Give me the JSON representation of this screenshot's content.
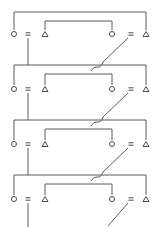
{
  "diagram": {
    "type": "repeating-switch-ladder",
    "stroke_color": "#5a5a5a",
    "background": "#ffffff",
    "stages": [
      {
        "index": 0,
        "symbol_y": 34,
        "left_symbols": [
          "circle",
          "equals",
          "triangle"
        ],
        "right_symbols": [
          "circle",
          "equals",
          "triangle"
        ],
        "outer_bracket_y": 12,
        "inner_bracket_y": 21
      },
      {
        "index": 1,
        "symbol_y": 89,
        "left_symbols": [
          "circle",
          "equals",
          "triangle"
        ],
        "right_symbols": [
          "circle",
          "equals",
          "triangle"
        ],
        "outer_bracket_y": 65,
        "inner_bracket_y": 74
      },
      {
        "index": 2,
        "symbol_y": 144,
        "left_symbols": [
          "circle",
          "equals",
          "triangle"
        ],
        "right_symbols": [
          "circle",
          "equals",
          "triangle"
        ],
        "outer_bracket_y": 120,
        "inner_bracket_y": 129
      },
      {
        "index": 3,
        "symbol_y": 199,
        "left_symbols": [
          "circle",
          "equals",
          "triangle"
        ],
        "right_symbols": [
          "circle",
          "equals",
          "triangle"
        ],
        "outer_bracket_y": 175,
        "inner_bracket_y": 184
      }
    ],
    "columns": {
      "outer_left_x": 14,
      "eq_left_x": 28,
      "inner_left_x": 45,
      "inner_right_x": 112,
      "eq_right_x": 131,
      "outer_right_x": 146
    },
    "icons": [
      "circle-terminal-icon",
      "equals-contact-icon",
      "triangle-terminal-icon",
      "diagonal-switch-icon",
      "wire-crossover-hop-icon"
    ]
  }
}
